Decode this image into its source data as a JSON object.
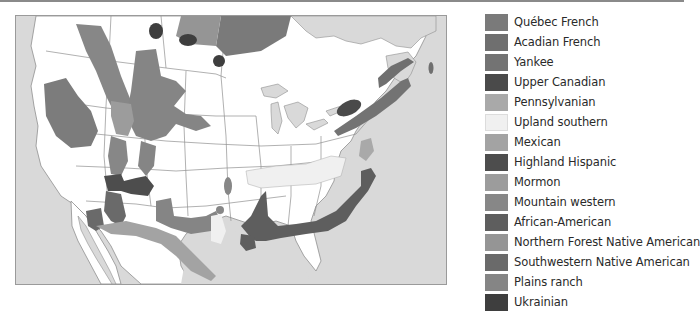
{
  "map": {
    "title": "",
    "region": "North America",
    "colors": {
      "ocean": "#d9d9d9",
      "land": "#ffffff",
      "border": "#8f8f8f"
    }
  },
  "legend": {
    "items": [
      {
        "label": "Québec French",
        "color": "#7a7a7a"
      },
      {
        "label": "Acadian French",
        "color": "#6f6f6f"
      },
      {
        "label": "Yankee",
        "color": "#737373"
      },
      {
        "label": "Upper Canadian",
        "color": "#4a4a4a"
      },
      {
        "label": "Pennsylvanian",
        "color": "#a9a9a9"
      },
      {
        "label": "Upland southern",
        "color": "#f0f0f0"
      },
      {
        "label": "Mexican",
        "color": "#a3a3a3"
      },
      {
        "label": "Highland Hispanic",
        "color": "#4d4d4d"
      },
      {
        "label": "Mormon",
        "color": "#9c9c9c"
      },
      {
        "label": "Mountain western",
        "color": "#878787"
      },
      {
        "label": "African-American",
        "color": "#5e5e5e"
      },
      {
        "label": "Northern Forest Native American",
        "color": "#959595"
      },
      {
        "label": "Southwestern Native American",
        "color": "#6a6a6a"
      },
      {
        "label": "Plains ranch",
        "color": "#858585"
      },
      {
        "label": "Ukrainian",
        "color": "#3e3e3e"
      }
    ]
  }
}
